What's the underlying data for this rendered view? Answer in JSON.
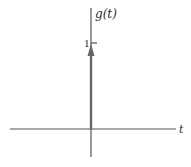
{
  "diagram": {
    "type": "impulse-function-plot",
    "y_axis_label": "g(t)",
    "x_axis_label": "t",
    "impulse": {
      "position": 0,
      "amplitude": 1,
      "amplitude_label": "1"
    },
    "colors": {
      "axis": "#555555",
      "impulse": "#666666",
      "text": "#2a2a2a",
      "background": "#ffffff"
    }
  }
}
